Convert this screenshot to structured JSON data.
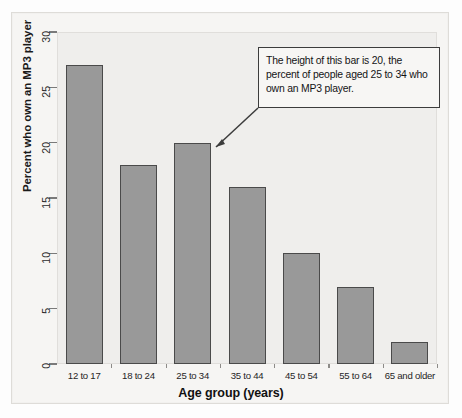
{
  "chart_data": {
    "type": "bar",
    "title": "",
    "xlabel": "Age group (years)",
    "ylabel": "Percent who own an MP3 player",
    "categories": [
      "12 to 17",
      "18 to 24",
      "25 to 34",
      "35 to 44",
      "45 to 54",
      "55 to 64",
      "65 and older"
    ],
    "values": [
      27,
      18,
      20,
      16,
      10,
      7,
      2
    ],
    "ylim": [
      0,
      30
    ],
    "yticks": [
      0,
      5,
      10,
      15,
      20,
      25,
      30
    ],
    "ytick_labels": [
      "0",
      "5",
      "10",
      "15",
      "20",
      "25",
      "30"
    ],
    "grid": false,
    "legend": false,
    "bar_color": "#999999",
    "bar_edge_color": "#4a4a4a",
    "plot_background": "#efeeec",
    "annotations": [
      {
        "name": "callout",
        "text": "The height of this bar is 20, the percent of people aged 25 to 34 who own an MP3 player.",
        "target_category": "25 to 34",
        "target_value": 20
      }
    ]
  }
}
